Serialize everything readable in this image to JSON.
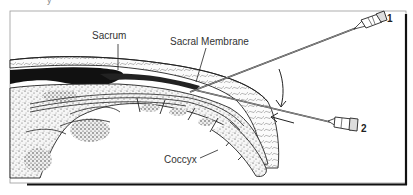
{
  "figure": {
    "type": "anatomical-illustration",
    "top_fragment": "y",
    "labels": {
      "sacrum": "Sacrum",
      "sacral_membrane": "Sacral Membrane",
      "coccyx": "Coccyx"
    },
    "needles": [
      {
        "id": "needle-1",
        "number": "1"
      },
      {
        "id": "needle-2",
        "number": "2"
      }
    ],
    "arrows": [
      {
        "id": "curved-arrow",
        "direction": "down"
      },
      {
        "id": "straight-arrow",
        "direction": "left"
      }
    ],
    "colors": {
      "ink": "#1a1a1a",
      "frame": "#222222",
      "bone_fill": "#f4f4f4",
      "dark_tissue": "#111111"
    }
  }
}
